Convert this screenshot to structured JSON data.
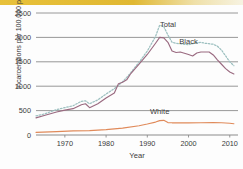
{
  "chart_data": {
    "type": "line",
    "title": "",
    "xlabel": "Year",
    "ylabel": "Incarcerations per 100,000 people",
    "xlim": [
      1963,
      2012
    ],
    "ylim": [
      0,
      2500
    ],
    "xticks": [
      1970,
      1980,
      1990,
      2000,
      2010
    ],
    "yticks": [
      0,
      500,
      1000,
      1500,
      2000,
      2500
    ],
    "grid": true,
    "legend_position": "inline-annotations",
    "annotations": [
      {
        "text": "Total",
        "x": 1995,
        "y": 2210
      },
      {
        "text": "Black",
        "x": 2000,
        "y": 1870
      },
      {
        "text": "White",
        "x": 1993,
        "y": 430
      }
    ],
    "series": [
      {
        "name": "Total",
        "style": "dashed",
        "color": "#9dc0c0",
        "x": [
          1963,
          1965,
          1968,
          1970,
          1972,
          1974,
          1975,
          1976,
          1978,
          1980,
          1982,
          1984,
          1985,
          1986,
          1988,
          1990,
          1992,
          1993,
          1994,
          1995,
          1996,
          1997,
          1998,
          2000,
          2001,
          2002,
          2003,
          2004,
          2005,
          2006,
          2007,
          2008,
          2009,
          2010,
          2011
        ],
        "y": [
          390,
          430,
          520,
          560,
          600,
          690,
          700,
          640,
          720,
          840,
          950,
          1090,
          1180,
          1280,
          1490,
          1720,
          2020,
          2250,
          2220,
          2050,
          1900,
          1880,
          1870,
          1850,
          1870,
          1890,
          1900,
          1880,
          1870,
          1860,
          1820,
          1740,
          1620,
          1500,
          1420
        ]
      },
      {
        "name": "Black",
        "style": "solid",
        "color": "#9a6a80",
        "x": [
          1963,
          1965,
          1968,
          1970,
          1972,
          1974,
          1975,
          1976,
          1978,
          1980,
          1982,
          1983,
          1984,
          1985,
          1986,
          1988,
          1990,
          1992,
          1993,
          1994,
          1995,
          1996,
          1997,
          1998,
          2000,
          2001,
          2002,
          2003,
          2004,
          2005,
          2006,
          2007,
          2008,
          2009,
          2010,
          2011
        ],
        "y": [
          350,
          400,
          470,
          510,
          540,
          620,
          640,
          560,
          640,
          760,
          860,
          1050,
          1080,
          1130,
          1260,
          1450,
          1650,
          1880,
          2000,
          1990,
          1900,
          1720,
          1690,
          1700,
          1650,
          1620,
          1680,
          1700,
          1700,
          1700,
          1640,
          1540,
          1450,
          1360,
          1290,
          1250
        ]
      },
      {
        "name": "White",
        "style": "solid",
        "color": "#e08a5a",
        "x": [
          1963,
          1968,
          1972,
          1976,
          1980,
          1984,
          1988,
          1990,
          1992,
          1993,
          1994,
          1995,
          1996,
          1998,
          2000,
          2003,
          2006,
          2008,
          2010,
          2011
        ],
        "y": [
          55,
          70,
          85,
          90,
          110,
          140,
          190,
          225,
          265,
          295,
          300,
          255,
          250,
          250,
          250,
          252,
          255,
          250,
          240,
          230
        ]
      }
    ]
  }
}
